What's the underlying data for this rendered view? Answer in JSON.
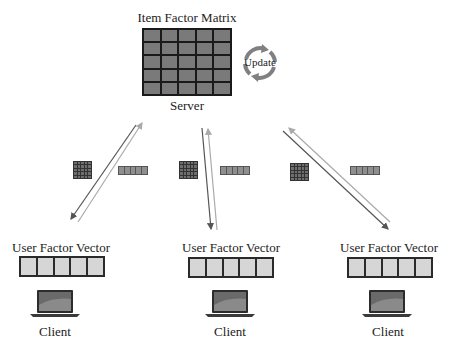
{
  "server": {
    "matrix_title": "Item Factor Matrix",
    "label": "Server",
    "update_label": "Update",
    "matrix_rows": 5,
    "matrix_cols": 5
  },
  "clients": [
    {
      "vector_title": "User Factor Vector",
      "label": "Client"
    },
    {
      "vector_title": "User Factor Vector",
      "label": "Client"
    },
    {
      "vector_title": "User Factor Vector",
      "label": "Client"
    }
  ],
  "colors": {
    "matrix_cell": "#7a7a7a",
    "matrix_border": "#1a1a1a",
    "vector_cell": "#d6d6d6",
    "arrow_dark": "#555555",
    "arrow_light": "#aaaaaa",
    "update_arrow": "#808080"
  },
  "icons": {
    "update": "circular-arrows-icon",
    "client": "laptop-icon",
    "transfer_matrix": "matrix-icon",
    "transfer_vector": "vector-icon"
  }
}
